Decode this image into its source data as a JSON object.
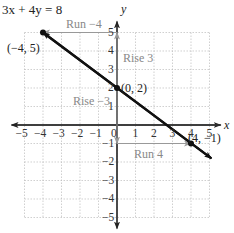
{
  "chart_data": {
    "type": "line",
    "title": "3x + 4y = 8",
    "xlabel": "x",
    "ylabel": "y",
    "xlim": [
      -5,
      5
    ],
    "ylim": [
      -5,
      5
    ],
    "grid": true,
    "x_ticks": [
      "−5",
      "−4",
      "−3",
      "−2",
      "−1",
      "0",
      "1",
      "2",
      "3",
      "4",
      "5"
    ],
    "y_ticks": [
      "5",
      "4",
      "3",
      "2",
      "1",
      "−1",
      "−2",
      "−3",
      "−4",
      "−5"
    ],
    "series": [
      {
        "name": "3x + 4y = 8",
        "x": [
          -4,
          5.1
        ],
        "y": [
          5,
          -1.8
        ]
      }
    ],
    "points": [
      {
        "label": "(−4, 5)",
        "x": -4,
        "y": 5
      },
      {
        "label": "(0, 2)",
        "x": 0,
        "y": 2
      },
      {
        "label": "(4, −1)",
        "x": 4,
        "y": -1
      }
    ],
    "annotations": [
      {
        "text": "Run −4",
        "from": [
          0,
          5
        ],
        "to": [
          -4,
          5
        ]
      },
      {
        "text": "Rise 3",
        "from": [
          0,
          2
        ],
        "to": [
          0,
          5
        ]
      },
      {
        "text": "Rise −3",
        "from": [
          0,
          2
        ],
        "to": [
          0,
          -1
        ]
      },
      {
        "text": "Run 4",
        "from": [
          0,
          -1
        ],
        "to": [
          4,
          -1
        ]
      }
    ]
  },
  "labels": {
    "equation": "3x + 4y = 8",
    "x_axis": "x",
    "y_axis": "y",
    "p1": "(−4, 5)",
    "p2": "(0, 2)",
    "p3": "(4, −1)",
    "run_neg": "Run −4",
    "rise_pos": "Rise 3",
    "rise_neg": "Rise −3",
    "run_pos": "Run 4"
  }
}
